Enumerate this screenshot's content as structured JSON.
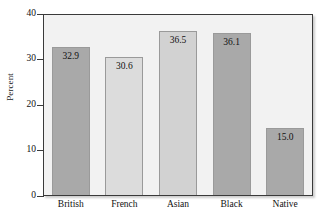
{
  "chart_data": {
    "type": "bar",
    "title": "",
    "subtitle": "",
    "xlabel": "",
    "ylabel": "Percent",
    "categories": [
      "British",
      "French",
      "Asian",
      "Black",
      "Native"
    ],
    "values": [
      32.9,
      30.6,
      36.5,
      36.1,
      15.0
    ],
    "value_labels": [
      "32.9",
      "30.6",
      "36.5",
      "36.1",
      "15.0"
    ],
    "bar_colors": [
      "#a9a9a9",
      "#dcdcdc",
      "#d2d2d2",
      "#a9a9a9",
      "#a9a9a9"
    ],
    "ylim": [
      0,
      40
    ],
    "yticks": [
      0,
      10,
      20,
      30,
      40
    ],
    "ytick_labels": [
      "0",
      "10",
      "20",
      "30",
      "40"
    ],
    "grid": false,
    "legend": null,
    "plot_background": "#f2f2f2",
    "figure_background": "#ffffff",
    "axis_color": "#3a3a3a"
  }
}
